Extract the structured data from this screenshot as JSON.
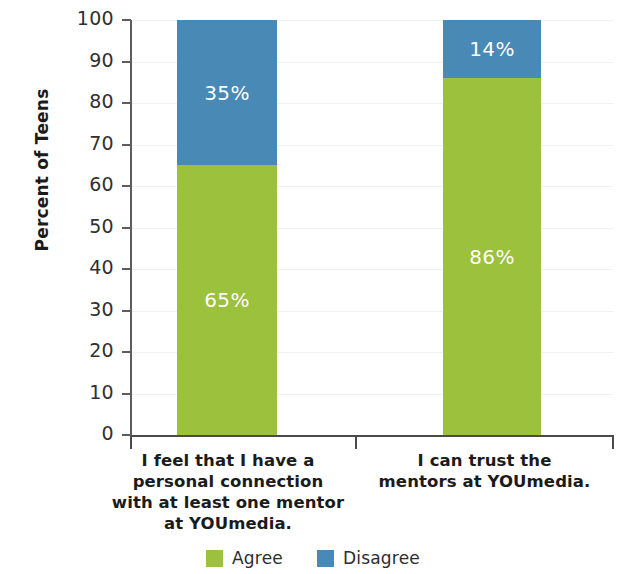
{
  "chart_data": {
    "type": "bar",
    "subtype": "stacked-bar-100",
    "title": "",
    "xlabel": "",
    "ylabel": "Percent of Teens",
    "ylim": [
      0,
      100
    ],
    "yticks": [
      0,
      10,
      20,
      30,
      40,
      50,
      60,
      70,
      80,
      90,
      100
    ],
    "ytick_labels": [
      "0",
      "10",
      "20",
      "30",
      "40",
      "50",
      "60",
      "70",
      "80",
      "90",
      "100"
    ],
    "grid": true,
    "legend_position": "bottom",
    "categories": [
      "I feel that I have a personal connection with at least one mentor at YOUmedia.",
      "I can trust the mentors at YOUmedia."
    ],
    "category_label_lines": [
      [
        "I feel that I have a",
        "personal connection",
        "with at least one mentor",
        "at YOUmedia."
      ],
      [
        "I can trust the",
        "mentors at YOUmedia."
      ]
    ],
    "series": [
      {
        "name": "Agree",
        "color": "#9cc13d",
        "values": [
          65,
          86
        ],
        "data_labels": [
          "65%",
          "86%"
        ]
      },
      {
        "name": "Disagree",
        "color": "#4889b5",
        "values": [
          35,
          14
        ],
        "data_labels": [
          "35%",
          "14%"
        ]
      }
    ]
  },
  "legend": {
    "items": [
      {
        "label": "Agree",
        "color": "#9cc13d"
      },
      {
        "label": "Disagree",
        "color": "#4889b5"
      }
    ]
  },
  "axis": {
    "y_title": "Percent of Teens"
  }
}
